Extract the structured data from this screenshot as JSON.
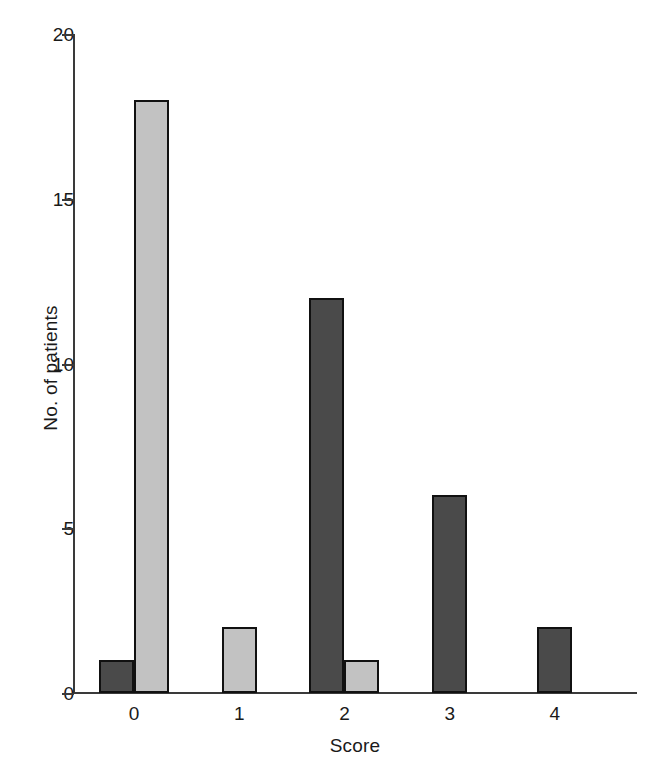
{
  "chart_data": {
    "type": "bar",
    "title": "",
    "xlabel": "Score",
    "ylabel": "No. of patients",
    "categories": [
      "0",
      "1",
      "2",
      "3",
      "4"
    ],
    "ylim": [
      0,
      20
    ],
    "yticks": [
      0,
      5,
      10,
      15,
      20
    ],
    "ytick_labels": [
      "0",
      "5",
      "10",
      "15",
      "20"
    ],
    "grid": false,
    "legend": "none",
    "series": [
      {
        "name": "dark",
        "color": "#4a4a4a",
        "values": [
          1,
          0,
          12,
          6,
          2
        ]
      },
      {
        "name": "light",
        "color": "#c2c2c2",
        "values": [
          18,
          2,
          1,
          0,
          0
        ]
      }
    ],
    "bars": [
      {
        "category": "0",
        "series": "dark",
        "value": 1,
        "color": "#4a4a4a"
      },
      {
        "category": "0",
        "series": "light",
        "value": 18,
        "color": "#c2c2c2"
      },
      {
        "category": "1",
        "series": "light",
        "value": 2,
        "color": "#c2c2c2"
      },
      {
        "category": "2",
        "series": "dark",
        "value": 12,
        "color": "#4a4a4a"
      },
      {
        "category": "2",
        "series": "light",
        "value": 1,
        "color": "#c2c2c2"
      },
      {
        "category": "3",
        "series": "dark",
        "value": 6,
        "color": "#4a4a4a"
      },
      {
        "category": "4",
        "series": "dark",
        "value": 2,
        "color": "#4a4a4a"
      }
    ]
  },
  "axis": {
    "y_label": "No. of patients",
    "x_label": "Score",
    "y_ticks": [
      {
        "label": "20",
        "value": 20
      },
      {
        "label": "15",
        "value": 15
      },
      {
        "label": "10",
        "value": 10
      },
      {
        "label": "5",
        "value": 5
      },
      {
        "label": "0",
        "value": 0
      }
    ],
    "x_ticks": [
      {
        "label": "0"
      },
      {
        "label": "1"
      },
      {
        "label": "2"
      },
      {
        "label": "3"
      },
      {
        "label": "4"
      }
    ]
  },
  "colors": {
    "dark_bar": "#4a4a4a",
    "light_bar": "#c2c2c2",
    "bar_outline": "#111111",
    "axis": "#3a3a3a",
    "text": "#1a1a1a",
    "background": "#ffffff"
  }
}
